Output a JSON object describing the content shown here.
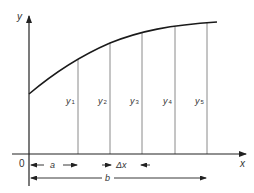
{
  "diagram": {
    "axes": {
      "x_label": "x",
      "y_label": "y",
      "origin_label": "0"
    },
    "curve": {
      "description": "increasing concave curve y = f(x)"
    },
    "ordinates": [
      {
        "label": "y",
        "sub": "1"
      },
      {
        "label": "y",
        "sub": "2"
      },
      {
        "label": "y",
        "sub": "3"
      },
      {
        "label": "y",
        "sub": "4"
      },
      {
        "label": "y",
        "sub": "5"
      }
    ],
    "dimensions": {
      "a_label": "a",
      "dx_label": "Δx",
      "b_label": "b"
    },
    "colors": {
      "curve": "#1a1a1a",
      "axes": "#222222",
      "ordinate_lines": "#8a8a8a",
      "text": "#333333"
    }
  }
}
